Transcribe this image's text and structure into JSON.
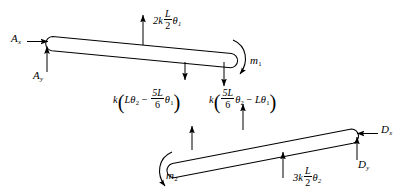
{
  "figure": {
    "background_color": "#ffffff",
    "line_color": "#000000"
  },
  "bars": [
    {
      "name": "upper-bar",
      "label": "AB",
      "support_end": "A",
      "free_end": "B"
    },
    {
      "name": "lower-bar",
      "label": "CD",
      "support_end": "D",
      "free_end": "C"
    }
  ],
  "labels": {
    "A_x": {
      "base": "A",
      "sub": "x"
    },
    "A_y": {
      "base": "A",
      "sub": "y"
    },
    "D_x": {
      "base": "D",
      "sub": "x"
    },
    "D_y": {
      "base": "D",
      "sub": "y"
    },
    "m_1": {
      "base": "m",
      "sub": "1"
    },
    "m_2": {
      "base": "m",
      "sub": "2"
    }
  },
  "forces": {
    "top_spring": {
      "coefficient": "2k",
      "fraction_num": "L",
      "fraction_den": "2",
      "theta": "θ",
      "theta_sub": "1",
      "direction": "up",
      "text": "2k L/2 θ₁"
    },
    "middle_left": {
      "k": "k",
      "term1_coef": "L",
      "term1_theta": "θ",
      "term1_sub": "2",
      "operator": "−",
      "term2_num": "5L",
      "term2_den": "6",
      "term2_theta": "θ",
      "term2_sub": "1",
      "direction": "down",
      "text": "k(Lθ₂ − 5L/6 θ₁)"
    },
    "middle_right": {
      "k": "k",
      "term1_num": "5L",
      "term1_den": "6",
      "term1_theta": "θ",
      "term1_sub": "2",
      "operator": "−",
      "term2_coef": "L",
      "term2_theta": "θ",
      "term2_sub": "1",
      "direction": "up",
      "text": "k(5L/6 θ₂ − Lθ₁)"
    },
    "bottom_spring": {
      "coefficient": "3k",
      "fraction_num": "L",
      "fraction_den": "2",
      "theta": "θ",
      "theta_sub": "2",
      "direction": "up",
      "text": "3k L/2 θ₂"
    }
  },
  "moments": {
    "m1": {
      "text": "m",
      "sub": "1",
      "sense": "clockwise",
      "location": "right-end-upper-bar"
    },
    "m2": {
      "text": "m",
      "sub": "2",
      "sense": "counterclockwise",
      "location": "left-end-lower-bar"
    }
  },
  "reactions": {
    "A_x": {
      "base": "A",
      "sub": "x",
      "direction": "right",
      "location": "left-end-upper-bar"
    },
    "A_y": {
      "base": "A",
      "sub": "y",
      "direction": "up",
      "location": "left-end-upper-bar"
    },
    "D_x": {
      "base": "D",
      "sub": "x",
      "direction": "left",
      "location": "right-end-lower-bar"
    },
    "D_y": {
      "base": "D",
      "sub": "y",
      "direction": "up",
      "location": "right-end-lower-bar"
    }
  }
}
